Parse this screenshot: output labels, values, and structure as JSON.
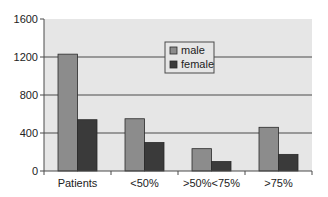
{
  "chart_data": {
    "type": "bar",
    "title": "",
    "xlabel": "",
    "ylabel": "",
    "categories": [
      "Patients",
      "<50%",
      ">50%<75%",
      ">75%"
    ],
    "series": [
      {
        "name": "male",
        "color": "#8c8c8c",
        "values": [
          1230,
          550,
          235,
          460
        ]
      },
      {
        "name": "female",
        "color": "#3a3a3a",
        "values": [
          540,
          300,
          100,
          175
        ]
      }
    ],
    "ylim": [
      0,
      1600
    ],
    "yticks": [
      0,
      400,
      800,
      1200,
      1600
    ],
    "grid": true,
    "legend_position": "top-center-inside",
    "plot_background": "#e6e6e6"
  }
}
